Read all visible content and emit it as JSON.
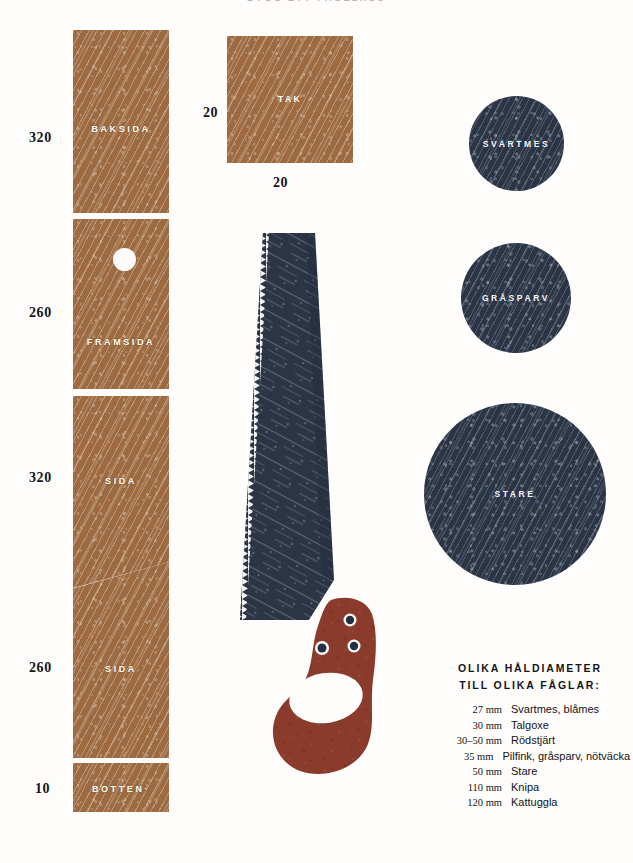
{
  "page": {
    "title_clipped": "BYGG  ETT  FÅGELHUS",
    "background_color": "#fefdfb"
  },
  "colors": {
    "tan": "#9d6a41",
    "navy": "#2b3546",
    "rust": "#8b3b2c",
    "ink": "#11141a",
    "paper": "#fefdfb"
  },
  "plank": {
    "pieces": [
      {
        "label": "BAKSIDA",
        "dimension": "320"
      },
      {
        "label": "FRAMSIDA",
        "dimension": "260"
      },
      {
        "label": "SIDA",
        "dimension": "320"
      },
      {
        "label": "SIDA",
        "dimension": "260"
      },
      {
        "label": "BOTTEN·",
        "dimension": "10"
      }
    ]
  },
  "roof": {
    "label": "TAK",
    "dimension_left": "20",
    "dimension_bottom": "20"
  },
  "circles": [
    {
      "name": "SVARTMES",
      "diameter_px": 95
    },
    {
      "name": "GRÅSPARV",
      "diameter_px": 110
    },
    {
      "name": "STARE",
      "diameter_px": 182
    }
  ],
  "saw": {
    "blade_color": "#2b3546",
    "handle_color": "#8b3b2c",
    "rivets": 3
  },
  "legend": {
    "title_line1": "OLIKA HÅLDIAMETER",
    "title_line2": "TILL OLIKA FÅGLAR:",
    "rows": [
      {
        "size": "27 mm",
        "birds": "Svartmes, blåmes"
      },
      {
        "size": "30 mm",
        "birds": "Talgoxe"
      },
      {
        "size": "30–50 mm",
        "birds": "Rödstjärt"
      },
      {
        "size": "35 mm",
        "birds": "Pilfink, gråsparv, nötväcka"
      },
      {
        "size": "50 mm",
        "birds": "Stare"
      },
      {
        "size": "110 mm",
        "birds": "Knipa"
      },
      {
        "size": "120 mm",
        "birds": "Kattuggla"
      }
    ]
  }
}
